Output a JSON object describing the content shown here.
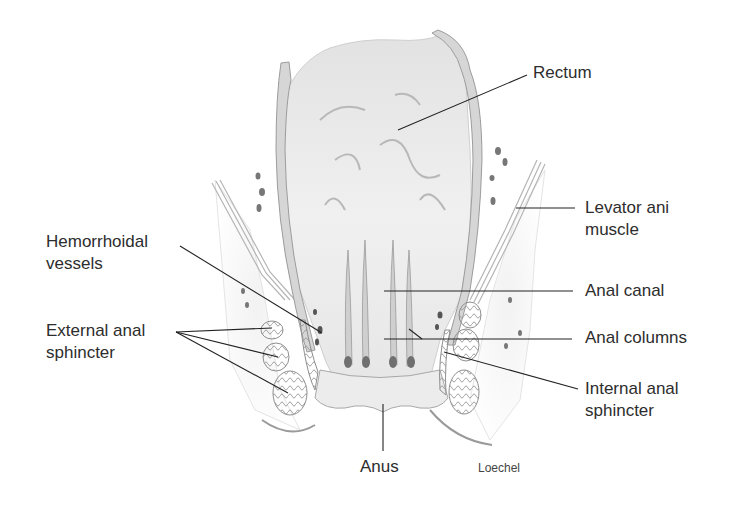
{
  "figure": {
    "type": "anatomical illustration",
    "signature": "Loechel"
  },
  "labels": {
    "rectum": {
      "lines": [
        "Rectum"
      ]
    },
    "levator_ani": {
      "lines": [
        "Levator ani",
        "muscle"
      ]
    },
    "hemorrhoidal_vessels": {
      "lines": [
        "Hemorrhoidal",
        "vessels"
      ]
    },
    "anal_canal": {
      "lines": [
        "Anal canal"
      ]
    },
    "external_anal_sphincter": {
      "lines": [
        "External anal",
        "sphincter"
      ]
    },
    "anal_columns": {
      "lines": [
        "Anal columns"
      ]
    },
    "internal_anal_sphincter": {
      "lines": [
        "Internal anal",
        "sphincter"
      ]
    },
    "anus": {
      "lines": [
        "Anus"
      ]
    }
  },
  "colors": {
    "background": "#ffffff",
    "text": "#2d2d2d",
    "leader_line": "#222222",
    "tissue_light": "#e9e9e9",
    "tissue_mid": "#c9c9c9",
    "tissue_dark": "#8a8a8a"
  }
}
